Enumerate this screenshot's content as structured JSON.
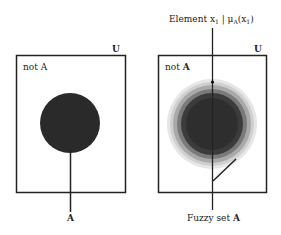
{
  "left_diagram": {
    "universe_label": "U",
    "complement_label_prefix": "not ",
    "complement_label_set": "A",
    "set_label": "A",
    "set_color": "#2a2a2a"
  },
  "right_diagram": {
    "universe_label": "U",
    "complement_label_prefix": "not ",
    "complement_label_set": "A",
    "element_label_prefix": "Element x",
    "element_label_sub": "1",
    "element_label_mid": " | μ",
    "element_label_mu_sub": "A",
    "element_label_paren": "(x",
    "element_label_paren_sub": "1",
    "element_label_close": ")",
    "fuzzy_set_label_prefix": "Fuzzy set ",
    "fuzzy_set_label_set": "A",
    "ring_colors": [
      "#e4e4e4",
      "#c6c6c6",
      "#9a9a9a",
      "#6e6e6e",
      "#3a3a3a"
    ]
  }
}
